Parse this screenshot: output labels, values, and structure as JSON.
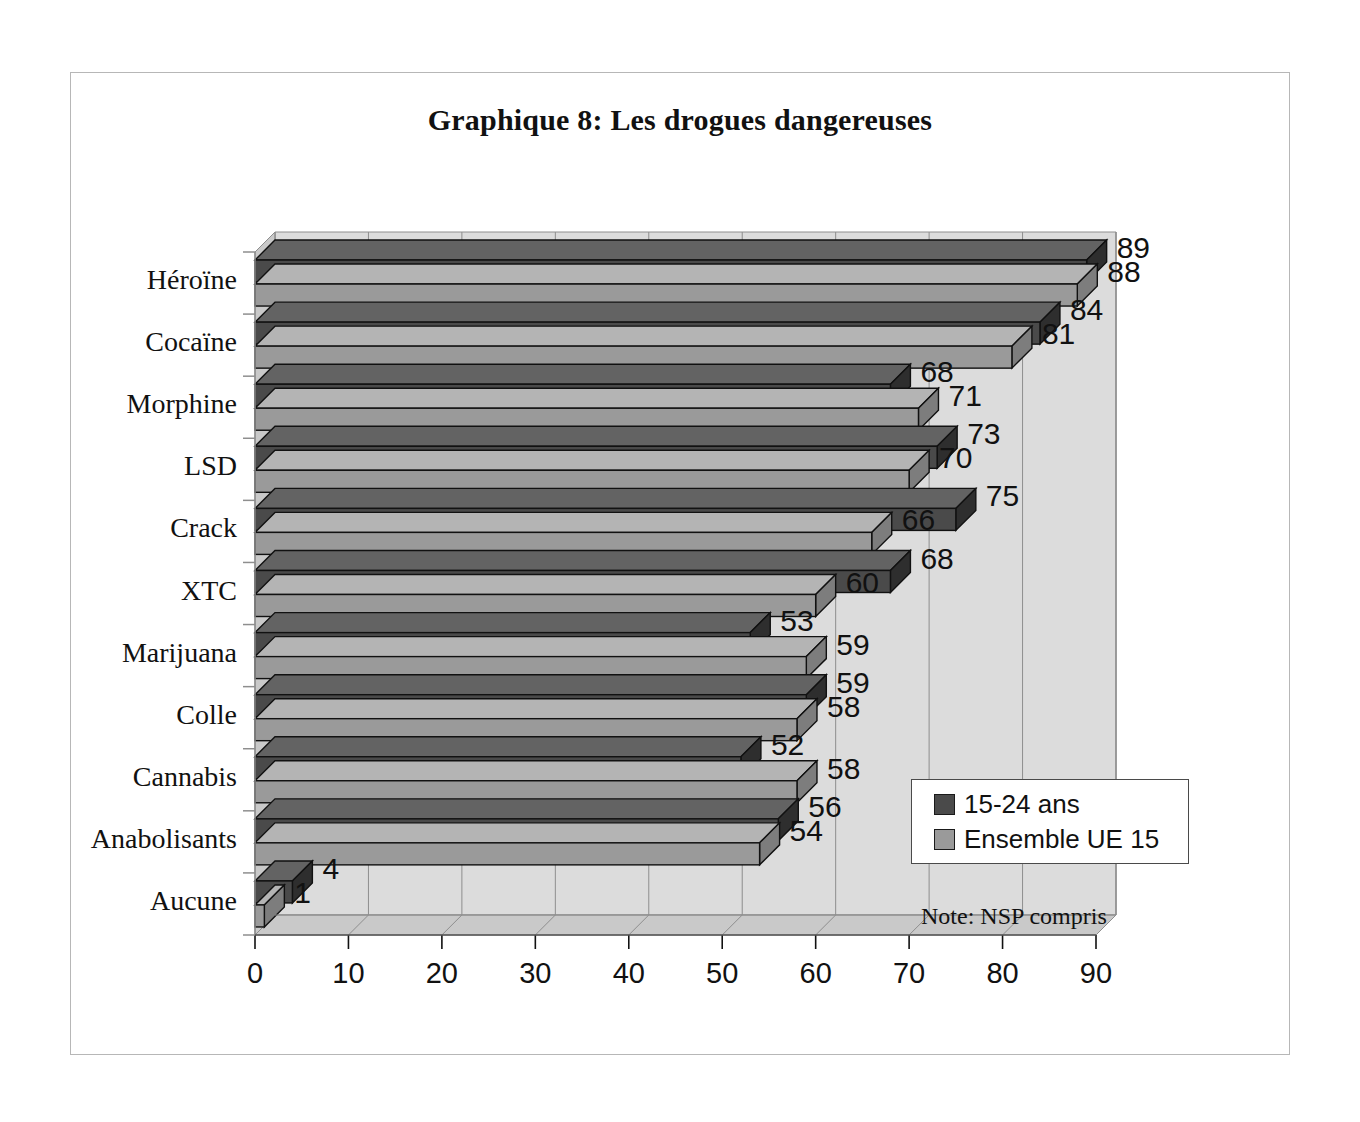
{
  "title": "Graphique 8: Les drogues dangereuses",
  "note": "Note: NSP compris",
  "legend": {
    "items": [
      {
        "label": "15-24 ans",
        "color": "#4a4a4a"
      },
      {
        "label": "Ensemble UE 15",
        "color": "#9a9a9a"
      }
    ]
  },
  "colors": {
    "series_1": "#4a4a4a",
    "series_1_top": "#636363",
    "series_1_side": "#2e2e2e",
    "series_2": "#9a9a9a",
    "series_2_top": "#b4b4b4",
    "series_2_side": "#7d7d7d",
    "plot_bg": "#dcdcdc",
    "wall_bg": "#c9c9c9",
    "grid": "#8e8e8e",
    "outline": "#111111",
    "frame": "#b7b7b7"
  },
  "chart_data": {
    "type": "bar",
    "orientation": "horizontal",
    "title": "Graphique 8: Les drogues dangereuses",
    "xlabel": "",
    "ylabel": "",
    "xlim": [
      0,
      90
    ],
    "xticks": [
      0,
      10,
      20,
      30,
      40,
      50,
      60,
      70,
      80,
      90
    ],
    "grid": true,
    "legend_position": "bottom-right",
    "note": "Note: NSP compris",
    "categories": [
      "Héroïne",
      "Cocaïne",
      "Morphine",
      "LSD",
      "Crack",
      "XTC",
      "Marijuana",
      "Colle",
      "Cannabis",
      "Anabolisants",
      "Aucune"
    ],
    "series": [
      {
        "name": "15-24 ans",
        "color": "#4a4a4a",
        "values": [
          89,
          84,
          68,
          73,
          75,
          68,
          53,
          59,
          52,
          56,
          4
        ]
      },
      {
        "name": "Ensemble UE 15",
        "color": "#9a9a9a",
        "values": [
          88,
          81,
          71,
          70,
          66,
          60,
          59,
          58,
          58,
          54,
          1
        ]
      }
    ]
  }
}
